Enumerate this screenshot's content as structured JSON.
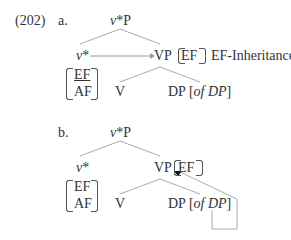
{
  "example_number": "(202)",
  "a": {
    "label": "a.",
    "root": {
      "head": "v",
      "rest": "*P"
    },
    "left": {
      "head": "v",
      "rest": "*"
    },
    "right": "VP",
    "feature_on_vp": "EF",
    "annotation": "EF-Inheritance",
    "features": [
      "EF",
      "AF"
    ],
    "v": "V",
    "dp": "DP [",
    "dp_of": "of DP",
    "dp_close": "]"
  },
  "b": {
    "label": "b.",
    "root": {
      "head": "v",
      "rest": "*P"
    },
    "left": {
      "head": "v",
      "rest": "*"
    },
    "right": "VP",
    "feature_on_vp": "EF",
    "features": [
      "EF",
      "AF"
    ],
    "v": "V",
    "dp": "DP [",
    "dp_of": "of DP",
    "dp_close": "]"
  },
  "colors": {
    "lines": "#999999",
    "text": "#333333"
  }
}
